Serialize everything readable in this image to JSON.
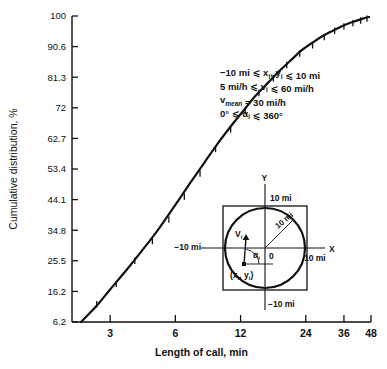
{
  "chart_data": {
    "type": "line",
    "title": "",
    "xlabel": "Length of call, min",
    "ylabel": "Cumulative distribution, %",
    "xticks": [
      3,
      6,
      12,
      24,
      36,
      48
    ],
    "xtick_labels": [
      "3",
      "6",
      "12",
      "24",
      "36",
      "48"
    ],
    "yticks": [
      6.2,
      16.2,
      25.5,
      34.8,
      44.1,
      53.4,
      62.7,
      72,
      81.3,
      90.6,
      100
    ],
    "ytick_labels": [
      "6.2",
      "16.2",
      "25.5",
      "34.8",
      "44.1",
      "53.4",
      "62.7",
      "72",
      "81.3",
      "90.6",
      "100"
    ],
    "xlim": [
      2.0,
      48
    ],
    "ylim": [
      6.2,
      100
    ],
    "xscale": "log",
    "grid": false,
    "legend_position": "upper-right-inside",
    "series": [
      {
        "name": "Cumulative distribution of length of call",
        "style": "solid-curve-with-tick-markers",
        "x": [
          2.2,
          2.6,
          3.0,
          3.6,
          4.2,
          5.0,
          6.0,
          7.0,
          8.2,
          9.5,
          11.0,
          12.5,
          14.0,
          16.0,
          18.0,
          20.5,
          23.0,
          26.0,
          29.0,
          32.0,
          35.0,
          38.0,
          41.0,
          44.0,
          47.0
        ],
        "y": [
          6.2,
          11.5,
          16.8,
          23.0,
          28.5,
          35.0,
          42.5,
          49.0,
          55.5,
          61.5,
          67.0,
          71.5,
          75.5,
          79.5,
          83.0,
          86.5,
          89.5,
          92.0,
          94.0,
          95.5,
          96.8,
          97.8,
          98.5,
          99.2,
          99.7
        ]
      }
    ],
    "data_markers": {
      "shape": "short-vertical-tick",
      "x": [
        2.6,
        3.2,
        3.9,
        4.7,
        5.6,
        6.6,
        7.8,
        9.2,
        10.8,
        12.6,
        14.6,
        17.0,
        19.6,
        22.5,
        25.8,
        29.2,
        32.6,
        36.0,
        39.6,
        43.0,
        46.0
      ],
      "y": [
        12.0,
        18.5,
        25.5,
        31.5,
        38.0,
        45.0,
        52.0,
        59.5,
        65.5,
        71.0,
        76.5,
        81.0,
        85.0,
        88.5,
        91.0,
        93.5,
        95.5,
        96.8,
        97.8,
        98.6,
        99.2
      ]
    }
  },
  "legend": {
    "lines": [
      {
        "prefix": "−10 mi ⩽ ",
        "var1": "x",
        "sub1": "i",
        "mid": ", ",
        "var2": "y",
        "sub2": "i",
        "suffix": " ⩽ 10 mi"
      },
      {
        "prefix": "5 mi/h ⩽ ",
        "var1": "v",
        "sub1": "i",
        "mid": "",
        "var2": "",
        "sub2": "",
        "suffix": " ⩽ 60 mi/h"
      },
      {
        "prefix": "",
        "var1": "v",
        "sub1": "mean",
        "mid": "",
        "var2": "",
        "sub2": "",
        "suffix": " = 30 mi/h"
      },
      {
        "prefix": "0° ⩽ ",
        "var1": "α",
        "sub1": "i",
        "mid": "",
        "var2": "",
        "sub2": "",
        "suffix": " ⩽ 360°"
      }
    ]
  },
  "inset": {
    "axis_x_label": "X",
    "axis_y_label": "Y",
    "origin_label": "0",
    "top_label": "10 mi",
    "bottom_label": "−10 mi",
    "left_label": "−10 mi",
    "right_label": "10 mi",
    "radius_label": "10 mi",
    "velocity_label": "V",
    "velocity_sub": "i",
    "angle_label": "α",
    "angle_sub": "i",
    "point_label_open": "(",
    "point_label_x": "x",
    "point_label_xsub": "i",
    "point_label_comma": ", ",
    "point_label_y": "y",
    "point_label_ysub": "i",
    "point_label_close": ")"
  }
}
